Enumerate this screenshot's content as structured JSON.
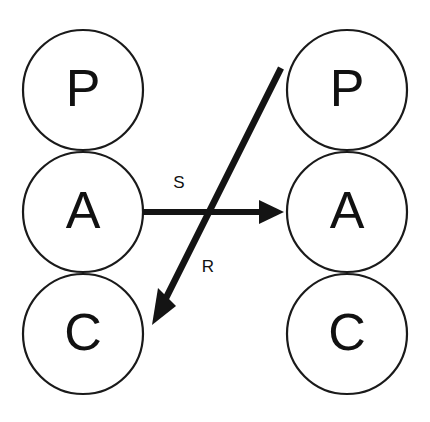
{
  "diagram": {
    "background_color": "#ffffff",
    "stroke_color": "#1a1a1a",
    "fill_color": "#ffffff",
    "edge_color": "#141414",
    "columns": [
      {
        "id": "left-agent",
        "name": "left-pac-agent",
        "center_x": 83,
        "radius": 60,
        "nodes": [
          {
            "id": "left-p",
            "label": "P",
            "center_y": 90
          },
          {
            "id": "left-a",
            "label": "A",
            "center_y": 212
          },
          {
            "id": "left-c",
            "label": "C",
            "center_y": 334
          }
        ]
      },
      {
        "id": "right-agent",
        "name": "right-pac-agent",
        "center_x": 347,
        "radius": 60,
        "nodes": [
          {
            "id": "right-p",
            "label": "P",
            "center_y": 90
          },
          {
            "id": "right-a",
            "label": "A",
            "center_y": 212
          },
          {
            "id": "right-c",
            "label": "C",
            "center_y": 334
          }
        ]
      }
    ],
    "edges": [
      {
        "id": "edge-s",
        "name": "stimulus-arrow",
        "label": "S",
        "from": "left-a",
        "to": "right-a",
        "x1": 143,
        "y1": 212,
        "x2": 284,
        "y2": 212,
        "label_x": 179,
        "label_y": 184
      },
      {
        "id": "edge-r",
        "name": "response-arrow",
        "label": "R",
        "from": "right-p",
        "to": "left-c",
        "x1": 281,
        "y1": 68,
        "x2": 152,
        "y2": 325,
        "label_x": 208,
        "label_y": 268
      }
    ]
  }
}
